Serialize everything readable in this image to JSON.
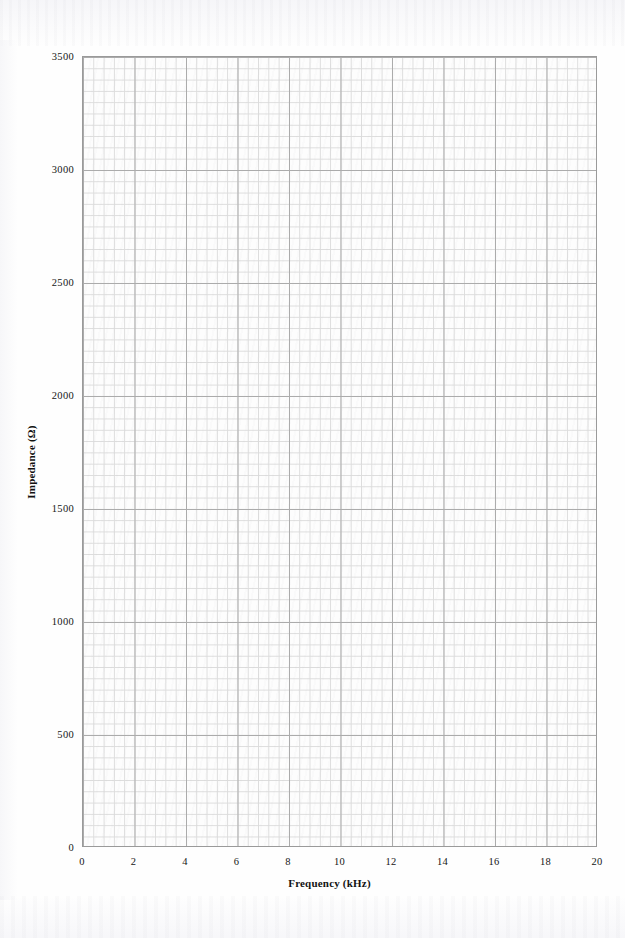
{
  "chart_data": {
    "type": "line",
    "title": "",
    "xlabel": "Frequency (kHz)",
    "ylabel": "Impedance (Ω)",
    "xlim": [
      0,
      20
    ],
    "ylim": [
      0,
      3500
    ],
    "xticks": [
      "0",
      "2",
      "4",
      "6",
      "8",
      "10",
      "12",
      "14",
      "16",
      "18",
      "20"
    ],
    "xtick_values": [
      0,
      2,
      4,
      6,
      8,
      10,
      12,
      14,
      16,
      18,
      20
    ],
    "yticks": [
      "0",
      "500",
      "1000",
      "1500",
      "2000",
      "2500",
      "3000",
      "3500"
    ],
    "ytick_values": [
      0,
      500,
      1000,
      1500,
      2000,
      2500,
      3000,
      3500
    ],
    "x_minor_step": 0.4,
    "y_minor_step": 50,
    "grid": true,
    "grid_minor": true,
    "legend": false,
    "series": [],
    "values": [],
    "categories": [],
    "annotations": [],
    "note": "Blank scanned graph-paper plotting grid; no data series plotted."
  },
  "style": {
    "grid_minor_color": "#dcdcdc",
    "grid_major_color": "#ababab",
    "frame_color": "#9a9a9a",
    "text_color": "#161616",
    "paper_color": "#fefefe"
  },
  "axes": {
    "y_axis_name": "y-axis",
    "x_axis_name": "x-axis"
  }
}
